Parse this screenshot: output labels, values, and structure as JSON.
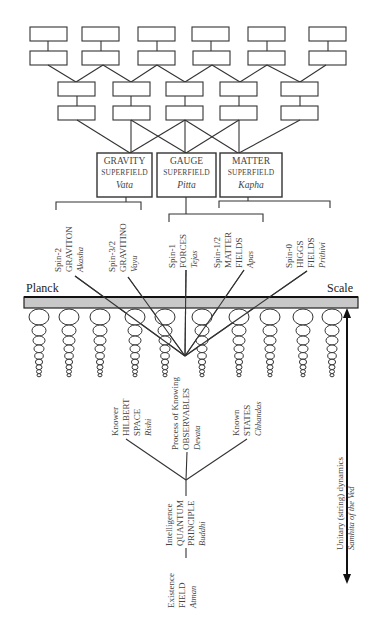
{
  "superfields": [
    {
      "title": "GRAVITY",
      "subtitle": "SUPERFIELD",
      "sanskrit": "Vata"
    },
    {
      "title": "GAUGE",
      "subtitle": "SUPERFIELD",
      "sanskrit": "Pitta"
    },
    {
      "title": "MATTER",
      "subtitle": "SUPERFIELD",
      "sanskrit": "Kapha"
    }
  ],
  "particles": [
    {
      "line1": "Spin-2",
      "line2": "GRAVITON",
      "line3": "Akasha"
    },
    {
      "line1": "Spin-3/2",
      "line2": "GRAVITINO",
      "line3": "Vayu"
    },
    {
      "line1": "Spin-1",
      "line2": "FORCES",
      "line3": "Tejas"
    },
    {
      "line1": "Spin-1/2",
      "line2": "MATTER",
      "line3": "FIELDS",
      "line4": "Apas"
    },
    {
      "line1": "Spin-0",
      "line2": "HIGGS",
      "line3": "FIELDS",
      "line4": "Prithivi"
    }
  ],
  "scale": {
    "left": "Planck",
    "right": "Scale"
  },
  "knowing": [
    {
      "line1": "Knower",
      "line2": "HILBERT",
      "line3": "SPACE",
      "line4": "Rishi"
    },
    {
      "line1": "Process of Knowing",
      "line2": "OBSERVABLES",
      "line3": "Devata"
    },
    {
      "line1": "Known",
      "line2": "STATES",
      "line3": "Chhandas"
    }
  ],
  "intelligence": {
    "line1": "Intelligence",
    "line2": "QUANTUM",
    "line3": "PRINCIPLE",
    "line4": "Buddhi"
  },
  "existence": {
    "line1": "Existence",
    "line2": "FIELD",
    "line3": "Atman"
  },
  "dynamics": {
    "line1": "Unitary (string) dynamics",
    "line2": "Samhita of the Ved"
  },
  "colors": {
    "line": "#333333",
    "bar": "#c8c8c8",
    "text": "#444444"
  }
}
